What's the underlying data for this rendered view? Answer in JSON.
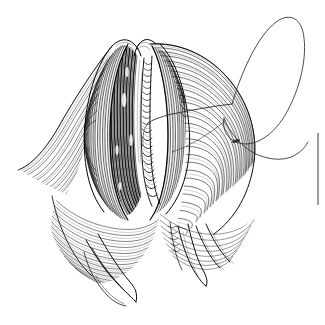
{
  "figure": {
    "title": "Anatomical pen-and-ink line illustration",
    "medium": "pen-and-ink stipple and line hatching",
    "background_color": "#ffffff",
    "ink_color": "#000000",
    "canvas": {
      "width": 325,
      "height": 325
    },
    "caption": "",
    "labels": [],
    "parts": [
      {
        "id": "left-lateral-flap",
        "name": "left lateral tissue flap",
        "description": "Broad curved flap sweeping to the left, rendered with long flowing parallel hatch lines that taper to a point at the lower left.",
        "tip": {
          "x": 18,
          "y": 168
        }
      },
      {
        "id": "left-lip",
        "name": "left everted lip",
        "description": "Rounded ridge forming the left margin of the central opening, shaded with dense curved hatching.",
        "center": {
          "x": 105,
          "y": 140
        }
      },
      {
        "id": "central-cavity",
        "name": "central cavity interior",
        "description": "Deeply shaded recess between the two lips, filled with very dense vertical hatching reading nearly solid black.",
        "center": {
          "x": 120,
          "y": 110
        }
      },
      {
        "id": "right-lip",
        "name": "right everted lip",
        "description": "Rounded ridge forming the right margin of the central opening, shaded with dense curved hatching.",
        "center": {
          "x": 175,
          "y": 140
        }
      },
      {
        "id": "ladder-band",
        "name": "central ladder band",
        "description": "Narrow vertical band of short transverse rungs resembling a twisted cord or suture ladder, running down the midline of the opening.",
        "top": {
          "x": 146,
          "y": 60
        },
        "bottom": {
          "x": 152,
          "y": 205
        }
      },
      {
        "id": "right-body-mass",
        "name": "right body mass",
        "description": "Large rounded mass at the right of the figure covered in close concentric hatch lines.",
        "center": {
          "x": 215,
          "y": 150
        }
      },
      {
        "id": "thread-loop",
        "name": "suture thread loop",
        "description": "Fine open loop of thread rising from the right of the figure, curving up and over to the upper right corner.",
        "apex": {
          "x": 280,
          "y": 22
        }
      },
      {
        "id": "thread-tail",
        "name": "suture thread tail",
        "description": "Long fine thread running from the loop down and across to the left, entering the central opening.",
        "entry": {
          "x": 148,
          "y": 122
        }
      },
      {
        "id": "lower-left-mass",
        "name": "lower left tissue mass",
        "description": "Rounded mass below the left lip with dense concentric hatch lines curving down and to the right.",
        "center": {
          "x": 95,
          "y": 225
        }
      },
      {
        "id": "lower-left-projection",
        "name": "lower left projection",
        "description": "Slender tapering finger-like projection extending down and to the right from the lower left mass.",
        "tip": {
          "x": 135,
          "y": 300
        }
      },
      {
        "id": "lower-right-projections",
        "name": "lower right projections",
        "description": "Group of slender tapering finger-like projections extending downward from the right body mass.",
        "tip": {
          "x": 205,
          "y": 278
        }
      },
      {
        "id": "page-edge-rule",
        "name": "page edge rule mark",
        "description": "Short thin vertical rule at the extreme right edge of the page, a printing or page-border artifact.",
        "x": 318,
        "y_start": 133,
        "y_end": 205
      }
    ]
  }
}
